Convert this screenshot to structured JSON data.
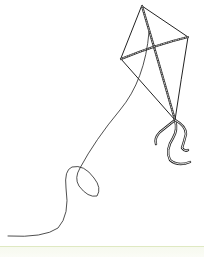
{
  "illustration": {
    "subject": "kite-line-drawing",
    "stroke_color": "#222222",
    "background_color": "#ffffff",
    "bottom_band_color": "#dfe9c2"
  }
}
